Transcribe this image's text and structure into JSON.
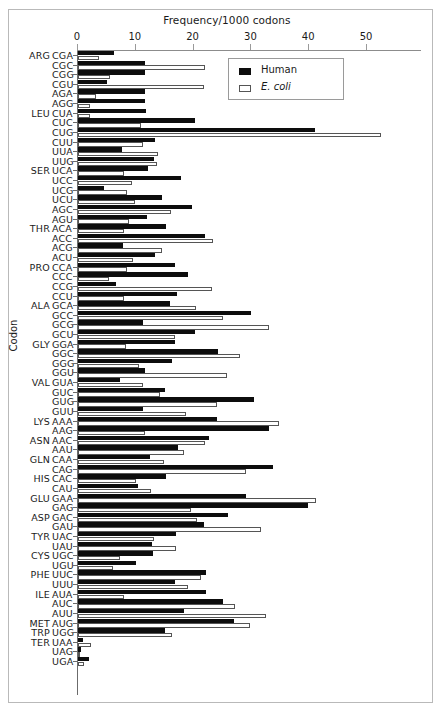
{
  "chart_data": {
    "type": "bar",
    "orientation": "horizontal",
    "title": "Frequency/1000 codons",
    "xlabel": "Frequency/1000 codons",
    "ylabel": "Codon",
    "xlim": [
      0,
      55
    ],
    "xticks": [
      0,
      10,
      20,
      30,
      40,
      50
    ],
    "grid": false,
    "legend_position": "top-right",
    "legend": [
      {
        "name": "Human",
        "style": "filled-black",
        "color": "#0d0d0d"
      },
      {
        "name": "E. coli",
        "style": "open-white",
        "color": "#ffffff",
        "italic": true
      }
    ],
    "series": [
      {
        "name": "Human",
        "color": "#0d0d0d"
      },
      {
        "name": "E. coli",
        "color": "#ffffff"
      }
    ],
    "categories": [
      "CGA",
      "CGC",
      "CGG",
      "CGU",
      "AGA",
      "AGG",
      "CUA",
      "CUC",
      "CUG",
      "CUU",
      "UUA",
      "UUG",
      "UCA",
      "UCC",
      "UCG",
      "UCU",
      "AGC",
      "AGU",
      "ACA",
      "ACC",
      "ACG",
      "ACU",
      "CCA",
      "CCC",
      "CCG",
      "CCU",
      "GCA",
      "GCC",
      "GCG",
      "GCU",
      "GGA",
      "GGC",
      "GGG",
      "GGU",
      "GUA",
      "GUC",
      "GUG",
      "GUU",
      "AAA",
      "AAG",
      "AAC",
      "AAU",
      "CAA",
      "CAG",
      "CAC",
      "CAU",
      "GAA",
      "GAG",
      "GAC",
      "GAU",
      "UAC",
      "UAU",
      "UGC",
      "UGU",
      "UUC",
      "UUU",
      "AUA",
      "AUC",
      "AUU",
      "AUG",
      "UGG",
      "UAA",
      "UAG",
      "UGA"
    ],
    "rows": [
      {
        "aa": "ARG",
        "codon": "CGA",
        "human": 6.2,
        "ecoli": 3.6
      },
      {
        "aa": "",
        "codon": "CGC",
        "human": 11.6,
        "ecoli": 22.0
      },
      {
        "aa": "",
        "codon": "CGG",
        "human": 11.6,
        "ecoli": 5.6
      },
      {
        "aa": "",
        "codon": "CGU",
        "human": 5.0,
        "ecoli": 21.8
      },
      {
        "aa": "",
        "codon": "AGA",
        "human": 11.6,
        "ecoli": 3.2
      },
      {
        "aa": "",
        "codon": "AGG",
        "human": 11.6,
        "ecoli": 2.1
      },
      {
        "aa": "LEU",
        "codon": "CUA",
        "human": 11.8,
        "ecoli": 2.1
      },
      {
        "aa": "",
        "codon": "CUC",
        "human": 20.3,
        "ecoli": 10.9
      },
      {
        "aa": "",
        "codon": "CUG",
        "human": 41.0,
        "ecoli": 52.4
      },
      {
        "aa": "",
        "codon": "CUU",
        "human": 13.4,
        "ecoli": 11.3
      },
      {
        "aa": "",
        "codon": "UUA",
        "human": 7.6,
        "ecoli": 13.9
      },
      {
        "aa": "",
        "codon": "UUG",
        "human": 13.1,
        "ecoli": 13.6
      },
      {
        "aa": "SER",
        "codon": "UCA",
        "human": 12.1,
        "ecoli": 8.0
      },
      {
        "aa": "",
        "codon": "UCC",
        "human": 17.8,
        "ecoli": 9.3
      },
      {
        "aa": "",
        "codon": "UCG",
        "human": 4.5,
        "ecoli": 8.5
      },
      {
        "aa": "",
        "codon": "UCU",
        "human": 14.6,
        "ecoli": 9.8
      },
      {
        "aa": "",
        "codon": "AGC",
        "human": 19.8,
        "ecoli": 16.1
      },
      {
        "aa": "",
        "codon": "AGU",
        "human": 11.9,
        "ecoli": 8.8
      },
      {
        "aa": "THR",
        "codon": "ACA",
        "human": 15.3,
        "ecoli": 8.0
      },
      {
        "aa": "",
        "codon": "ACC",
        "human": 22.0,
        "ecoli": 23.4
      },
      {
        "aa": "",
        "codon": "ACG",
        "human": 7.8,
        "ecoli": 14.5
      },
      {
        "aa": "",
        "codon": "ACU",
        "human": 13.4,
        "ecoli": 9.6
      },
      {
        "aa": "PRO",
        "codon": "CCA",
        "human": 16.8,
        "ecoli": 8.5
      },
      {
        "aa": "",
        "codon": "CCC",
        "human": 19.1,
        "ecoli": 5.4
      },
      {
        "aa": "",
        "codon": "CCG",
        "human": 6.6,
        "ecoli": 23.2
      },
      {
        "aa": "",
        "codon": "CCU",
        "human": 17.1,
        "ecoli": 8.0
      },
      {
        "aa": "ALA",
        "codon": "GCA",
        "human": 15.9,
        "ecoli": 20.4
      },
      {
        "aa": "",
        "codon": "GCC",
        "human": 29.9,
        "ecoli": 25.0
      },
      {
        "aa": "",
        "codon": "GCG",
        "human": 11.2,
        "ecoli": 33.0
      },
      {
        "aa": "",
        "codon": "GCU",
        "human": 20.2,
        "ecoli": 16.8
      },
      {
        "aa": "GLY",
        "codon": "GGA",
        "human": 16.8,
        "ecoli": 8.3
      },
      {
        "aa": "",
        "codon": "GGC",
        "human": 24.2,
        "ecoli": 28.0
      },
      {
        "aa": "",
        "codon": "GGG",
        "human": 16.3,
        "ecoli": 10.6
      },
      {
        "aa": "",
        "codon": "GGU",
        "human": 11.6,
        "ecoli": 25.8
      },
      {
        "aa": "VAL",
        "codon": "GUA",
        "human": 7.2,
        "ecoli": 11.3
      },
      {
        "aa": "",
        "codon": "GUC",
        "human": 15.0,
        "ecoli": 14.2
      },
      {
        "aa": "",
        "codon": "GUG",
        "human": 30.5,
        "ecoli": 24.0
      },
      {
        "aa": "",
        "codon": "GUU",
        "human": 11.2,
        "ecoli": 18.6
      },
      {
        "aa": "LYS",
        "codon": "AAA",
        "human": 24.0,
        "ecoli": 34.8
      },
      {
        "aa": "",
        "codon": "AAG",
        "human": 33.1,
        "ecoli": 11.6
      },
      {
        "aa": "ASN",
        "codon": "AAC",
        "human": 22.6,
        "ecoli": 22.0
      },
      {
        "aa": "",
        "codon": "AAU",
        "human": 17.3,
        "ecoli": 18.4
      },
      {
        "aa": "GLN",
        "codon": "CAA",
        "human": 12.4,
        "ecoli": 14.8
      },
      {
        "aa": "",
        "codon": "CAG",
        "human": 33.8,
        "ecoli": 29.1
      },
      {
        "aa": "HIS",
        "codon": "CAC",
        "human": 15.3,
        "ecoli": 10.0
      },
      {
        "aa": "",
        "codon": "CAU",
        "human": 10.4,
        "ecoli": 12.6
      },
      {
        "aa": "GLU",
        "codon": "GAA",
        "human": 29.0,
        "ecoli": 41.1
      },
      {
        "aa": "",
        "codon": "GAG",
        "human": 39.8,
        "ecoli": 19.6
      },
      {
        "aa": "ASP",
        "codon": "GAC",
        "human": 26.0,
        "ecoli": 20.6
      },
      {
        "aa": "",
        "codon": "GAU",
        "human": 21.8,
        "ecoli": 31.6
      },
      {
        "aa": "TYR",
        "codon": "UAC",
        "human": 16.9,
        "ecoli": 13.1
      },
      {
        "aa": "",
        "codon": "UAU",
        "human": 12.8,
        "ecoli": 17.0
      },
      {
        "aa": "CYS",
        "codon": "UGC",
        "human": 13.0,
        "ecoli": 7.3
      },
      {
        "aa": "",
        "codon": "UGU",
        "human": 10.0,
        "ecoli": 6.0
      },
      {
        "aa": "PHE",
        "codon": "UUC",
        "human": 22.1,
        "ecoli": 21.3
      },
      {
        "aa": "",
        "codon": "UUU",
        "human": 16.8,
        "ecoli": 19.0
      },
      {
        "aa": "ILE",
        "codon": "AUA",
        "human": 22.1,
        "ecoli": 8.0
      },
      {
        "aa": "",
        "codon": "AUC",
        "human": 25.0,
        "ecoli": 27.1
      },
      {
        "aa": "",
        "codon": "AUU",
        "human": 18.3,
        "ecoli": 32.5
      },
      {
        "aa": "MET",
        "codon": "AUG",
        "human": 27.0,
        "ecoli": 29.8
      },
      {
        "aa": "TRP",
        "codon": "UGG",
        "human": 15.1,
        "ecoli": 16.3
      },
      {
        "aa": "TER",
        "codon": "UAA",
        "human": 0.8,
        "ecoli": 2.2
      },
      {
        "aa": "",
        "codon": "UAG",
        "human": 0.5,
        "ecoli": 0.3
      },
      {
        "aa": "",
        "codon": "UGA",
        "human": 1.9,
        "ecoli": 1.1
      }
    ]
  }
}
